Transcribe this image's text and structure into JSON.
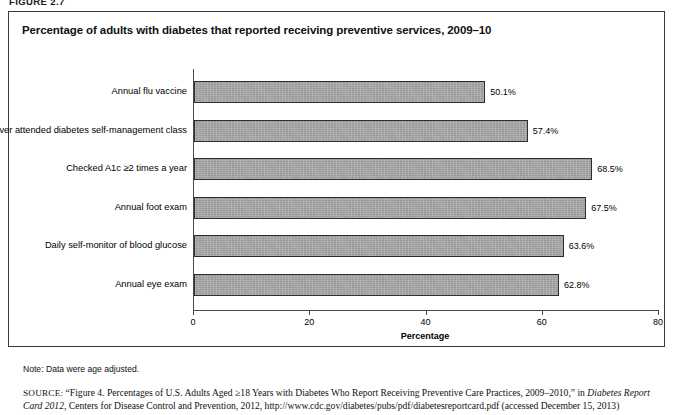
{
  "figure": {
    "label": "FIGURE 2.7",
    "title": "Percentage of adults with diabetes that reported receiving preventive services, 2009–10",
    "note": "Note: Data were age adjusted.",
    "source_prefix": "SOURCE:",
    "source_part1": " “Figure 4. Percentages of U.S. Adults Aged ≥18 Years with Diabetes Who Report Receiving Preventive Care Practices, 2009–2010,” in ",
    "source_italic1": "Diabetes Report Card 2012",
    "source_part2": ", Centers for Disease Control and Prevention, 2012, http://www.cdc.gov/diabetes/pubs/pdf/diabetesreportcard.pdf (accessed December 15, 2013)"
  },
  "chart_data": {
    "type": "bar",
    "orientation": "horizontal",
    "title": "Percentage of adults with diabetes that reported receiving preventive services, 2009–10",
    "xlabel": "Percentage",
    "ylabel": "",
    "xlim": [
      0,
      80
    ],
    "xticks": [
      0,
      20,
      40,
      60,
      80
    ],
    "xtick_labels": [
      "0",
      "20",
      "40",
      "60",
      "80"
    ],
    "grid": false,
    "legend": false,
    "bar_color": "#a9a9a9",
    "bar_edge_color": "#2e2e2e",
    "categories": [
      "Annual flu vaccine",
      "Ever attended diabetes self-management class",
      "Checked A1c ≥2 times a year",
      "Annual foot exam",
      "Daily self-monitor of blood glucose",
      "Annual eye exam"
    ],
    "values": [
      50.1,
      57.4,
      68.5,
      67.5,
      63.6,
      62.8
    ],
    "value_labels": [
      "50.1%",
      "57.4%",
      "68.5%",
      "67.5%",
      "63.6%",
      "62.8%"
    ]
  }
}
